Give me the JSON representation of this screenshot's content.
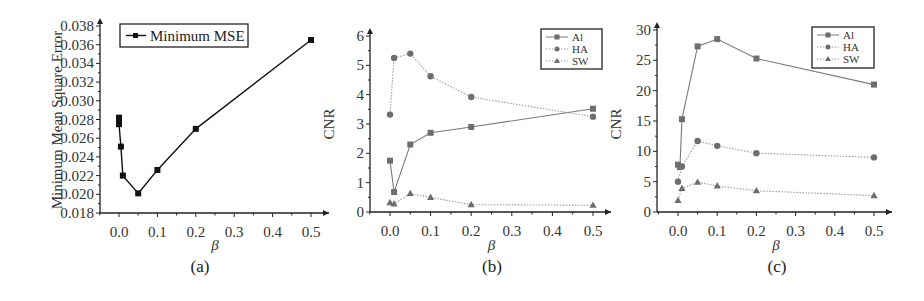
{
  "chart_data": [
    {
      "panel": "(a)",
      "type": "line",
      "title": "",
      "xlabel": "β",
      "ylabel": "Minimum Mean Square Error",
      "xlim": [
        -0.05,
        0.55
      ],
      "ylim": [
        0.018,
        0.038
      ],
      "xticks": [
        "0.0",
        "0.1",
        "0.2",
        "0.3",
        "0.4",
        "0.5"
      ],
      "yticks": [
        "0.018",
        "0.020",
        "0.022",
        "0.024",
        "0.026",
        "0.028",
        "0.030",
        "0.032",
        "0.034",
        "0.036",
        "0.038"
      ],
      "legend": [
        "Minimum MSE"
      ],
      "legend_position": "upper left",
      "series": [
        {
          "name": "Minimum MSE",
          "x": [
            0.0,
            0.0,
            0.0,
            0.0,
            0.005,
            0.01,
            0.05,
            0.1,
            0.2,
            0.5
          ],
          "values": [
            0.0282,
            0.028,
            0.0278,
            0.0275,
            0.0251,
            0.022,
            0.0201,
            0.0226,
            0.027,
            0.0365
          ]
        }
      ]
    },
    {
      "panel": "(b)",
      "type": "line",
      "title": "",
      "xlabel": "β",
      "ylabel": "CNR",
      "xlim": [
        -0.05,
        0.55
      ],
      "ylim": [
        0,
        6
      ],
      "xticks": [
        "0.0",
        "0.1",
        "0.2",
        "0.3",
        "0.4",
        "0.5"
      ],
      "yticks": [
        "0",
        "1",
        "2",
        "3",
        "4",
        "5",
        "6"
      ],
      "legend": [
        "Al",
        "HA",
        "SW"
      ],
      "legend_position": "upper right",
      "x": [
        0.0,
        0.01,
        0.05,
        0.1,
        0.2,
        0.5
      ],
      "series": [
        {
          "name": "Al",
          "marker": "square",
          "line": "solid",
          "values": [
            1.75,
            0.68,
            2.3,
            2.7,
            2.9,
            3.52
          ]
        },
        {
          "name": "HA",
          "marker": "circle",
          "line": "dotted",
          "values": [
            3.32,
            5.25,
            5.4,
            4.63,
            3.92,
            3.25
          ]
        },
        {
          "name": "SW",
          "marker": "triangle",
          "line": "dotted",
          "values": [
            0.32,
            0.28,
            0.63,
            0.5,
            0.25,
            0.23
          ]
        }
      ]
    },
    {
      "panel": "(c)",
      "type": "line",
      "title": "",
      "xlabel": "β",
      "ylabel": "CNR",
      "xlim": [
        -0.05,
        0.55
      ],
      "ylim": [
        0,
        32
      ],
      "xticks": [
        "0.0",
        "0.1",
        "0.2",
        "0.3",
        "0.4",
        "0.5"
      ],
      "yticks": [
        "0",
        "5",
        "10",
        "15",
        "20",
        "25",
        "30"
      ],
      "legend": [
        "Al",
        "HA",
        "SW"
      ],
      "legend_position": "upper right",
      "x": [
        0.0,
        0.005,
        0.01,
        0.05,
        0.1,
        0.2,
        0.5
      ],
      "series": [
        {
          "name": "Al",
          "marker": "square",
          "line": "solid",
          "values": [
            7.8,
            7.4,
            15.3,
            27.3,
            28.5,
            25.3,
            21.0
          ]
        },
        {
          "name": "HA",
          "marker": "circle",
          "line": "dotted",
          "values": [
            5.0,
            null,
            7.5,
            11.7,
            10.9,
            9.7,
            9.0
          ]
        },
        {
          "name": "SW",
          "marker": "triangle",
          "line": "dotted",
          "values": [
            1.9,
            null,
            3.9,
            4.9,
            4.3,
            3.5,
            2.7
          ]
        }
      ]
    }
  ],
  "labels": {
    "a": {
      "ylabel": "Minimum Mean Square Error",
      "xlabel": "β",
      "panel": "(a)",
      "legend": "Minimum MSE"
    },
    "b": {
      "ylabel": "CNR",
      "xlabel": "β",
      "panel": "(b)",
      "legend": [
        "Al",
        "HA",
        "SW"
      ]
    },
    "c": {
      "ylabel": "CNR",
      "xlabel": "β",
      "panel": "(c)",
      "legend": [
        "Al",
        "HA",
        "SW"
      ]
    }
  },
  "colors": {
    "axis": "#222222",
    "line_a": "#111111",
    "marker": "#6e6e6e",
    "line_series": "#7a7a7a",
    "dotted_series": "#9a9a9a"
  }
}
